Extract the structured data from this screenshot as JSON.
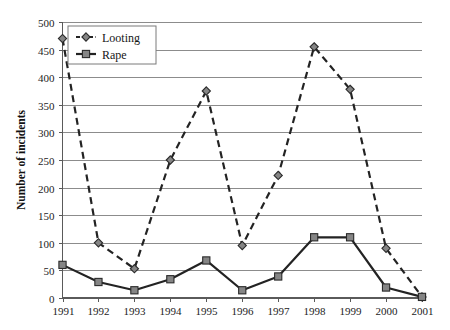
{
  "chart_data": {
    "type": "line",
    "title": "",
    "xlabel": "",
    "ylabel": "Number of incidents",
    "categories": [
      "1991",
      "1992",
      "1993",
      "1994",
      "1995",
      "1996",
      "1997",
      "1998",
      "1999",
      "2000",
      "2001"
    ],
    "ylim": [
      0,
      500
    ],
    "ytick_step": 50,
    "yticks": [
      "0",
      "50",
      "100",
      "150",
      "200",
      "250",
      "300",
      "350",
      "400",
      "450",
      "500"
    ],
    "grid": true,
    "legend_position": "top-left-inside",
    "series": [
      {
        "name": "Looting",
        "marker": "diamond",
        "linestyle": "dashed",
        "color": "#232323",
        "values": [
          470,
          100,
          53,
          250,
          375,
          95,
          222,
          455,
          378,
          90,
          2
        ]
      },
      {
        "name": "Rape",
        "marker": "square",
        "linestyle": "solid",
        "color": "#232323",
        "values": [
          60,
          29,
          14,
          34,
          68,
          14,
          39,
          110,
          110,
          19,
          2
        ]
      }
    ]
  },
  "legend": {
    "entries": [
      {
        "label": "Looting"
      },
      {
        "label": "Rape"
      }
    ]
  },
  "axes": {
    "y_axis_title": "Number of incidents"
  },
  "colors": {
    "gridline": "#8c8c8c",
    "axis": "#5a5a5a",
    "series_line": "#232323",
    "marker_fill": "#858585",
    "marker_stroke": "#2a2a2a",
    "background": "#ffffff"
  }
}
